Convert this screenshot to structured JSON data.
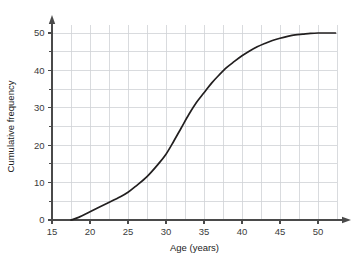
{
  "chart_data": {
    "type": "line",
    "title": "",
    "subtitle": "",
    "xlabel": "Age (years)",
    "ylabel": "Cumulative frequency",
    "xlim": [
      15,
      52.5
    ],
    "ylim": [
      0,
      53
    ],
    "xticks": [
      15,
      20,
      25,
      30,
      35,
      40,
      45,
      50
    ],
    "xtick_labels": [
      "15",
      "20",
      "25",
      "30",
      "35",
      "40",
      "45",
      "50"
    ],
    "yticks": [
      0,
      10,
      20,
      30,
      40,
      50
    ],
    "ytick_labels": [
      "0",
      "10",
      "20",
      "30",
      "40",
      "50"
    ],
    "minor_grid_step_x": 2.5,
    "minor_grid_step_y": 5,
    "grid": true,
    "legend": null,
    "legend_position": "none",
    "series": [
      {
        "name": "Cumulative frequency",
        "color": "#221f1f",
        "x": [
          17.5,
          18.5,
          20,
          22,
          24,
          25,
          26,
          27.5,
          29,
          30,
          31,
          32,
          33,
          34,
          35,
          36,
          37,
          38,
          39,
          40,
          41,
          42,
          43,
          44,
          45,
          46,
          47,
          48,
          49,
          50,
          51,
          52.3
        ],
        "y": [
          0,
          0.7,
          2.2,
          4.2,
          6.2,
          7.4,
          9.0,
          11.6,
          15.0,
          17.6,
          21.0,
          24.6,
          28.2,
          31.4,
          34.0,
          36.6,
          38.8,
          40.8,
          42.4,
          43.9,
          45.2,
          46.3,
          47.2,
          48.0,
          48.6,
          49.1,
          49.5,
          49.7,
          49.9,
          50.0,
          50.0,
          50.0
        ]
      }
    ],
    "annotations": [],
    "axis_arrow_x": true,
    "axis_arrow_y": true,
    "colors": {
      "curve": "#221f1f",
      "grid": "#cfd2d6",
      "axis": "#4a4a4a",
      "text": "#2a2a2a",
      "background": "#ffffff"
    }
  }
}
